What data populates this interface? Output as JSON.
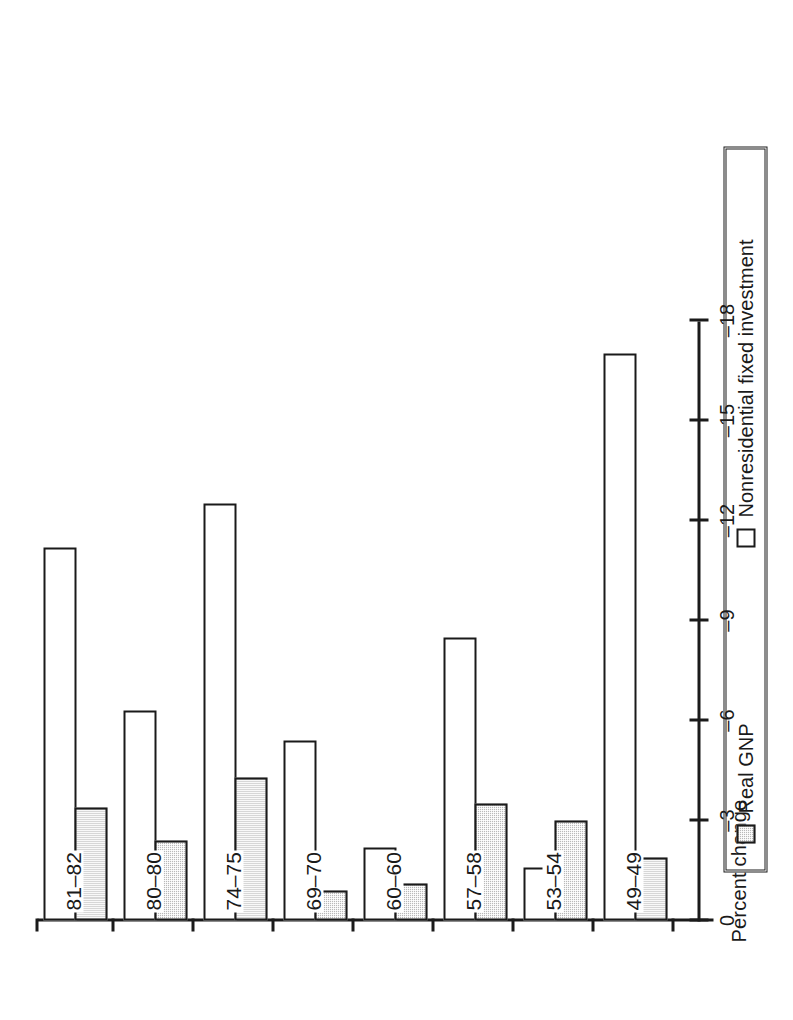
{
  "chart_data": {
    "type": "bar",
    "orientation": "horizontal",
    "title": "",
    "xlabel": "Percent change",
    "ylabel": "",
    "categories": [
      "49–49",
      "53–54",
      "57–58",
      "60–60",
      "69–70",
      "74–75",
      "80–80",
      "81–82"
    ],
    "series": [
      {
        "name": "Real GNP",
        "fill": "shaded",
        "values": [
          -1.9,
          -3.0,
          -3.5,
          -1.1,
          -0.9,
          -4.3,
          -2.4,
          -3.4
        ]
      },
      {
        "name": "Nonresidential fixed investment",
        "fill": "open",
        "values": [
          -17.0,
          -1.6,
          -8.5,
          -2.2,
          -5.4,
          -12.5,
          -6.3,
          -11.2
        ]
      }
    ],
    "xticks": [
      "0",
      "–3",
      "–6",
      "–9",
      "–12",
      "–15",
      "–18"
    ],
    "xtick_values": [
      0,
      -3,
      -6,
      -9,
      -12,
      -15,
      -18
    ],
    "xlim": [
      0,
      -18
    ],
    "grid": false,
    "legend_position": "bottom",
    "colors": {
      "shaded_fill": "#b9b9b9",
      "outline": "#1a1a1a",
      "open_fill": "#ffffff"
    }
  },
  "legend": {
    "items": [
      {
        "label": "Real GNP",
        "swatch": "shaded"
      },
      {
        "label": "Nonresidential fixed investment",
        "swatch": "open"
      }
    ]
  }
}
